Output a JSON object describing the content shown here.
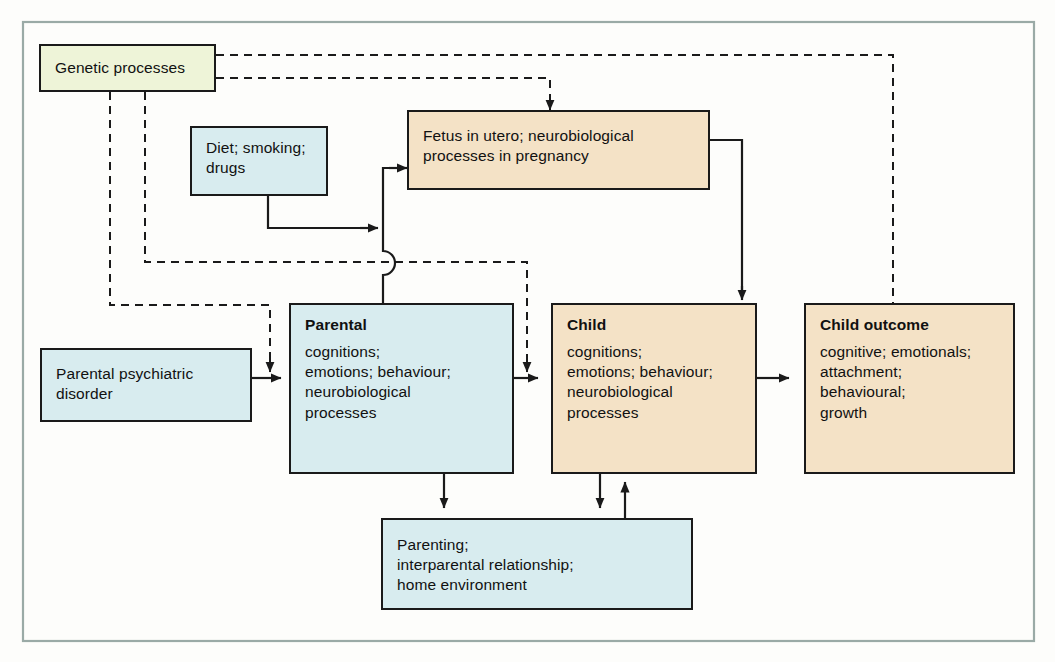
{
  "figure": {
    "kind": "flow-diagram",
    "frame_border_color": "#9aaaa6",
    "background": "#fdfdfb"
  },
  "palette": {
    "genetic_fill": "#eef4d8",
    "parental_fill": "#d8ecef",
    "child_fill": "#f4e2c6",
    "stroke": "#1a1a1a"
  },
  "nodes": {
    "genetic": {
      "id": "genetic-processes",
      "title": "",
      "body": "Genetic processes",
      "fill": "#eef4d8"
    },
    "diet": {
      "id": "diet-smoking-drugs",
      "title": "",
      "body": "Diet; smoking;\ndrugs",
      "fill": "#d8ecef"
    },
    "fetus": {
      "id": "fetus-in-utero",
      "title": "",
      "body": "Fetus in utero; neurobiological\nprocesses in pregnancy",
      "fill": "#f4e2c6"
    },
    "psychiatric": {
      "id": "parental-psychiatric-disorder",
      "title": "",
      "body": "Parental psychiatric\ndisorder",
      "fill": "#d8ecef"
    },
    "parental": {
      "id": "parental",
      "title": "Parental",
      "body": "cognitions;\nemotions; behaviour;\nneurobiological\nprocesses",
      "fill": "#d8ecef"
    },
    "child": {
      "id": "child",
      "title": "Child",
      "body": "cognitions;\nemotions; behaviour;\nneurobiological\nprocesses",
      "fill": "#f4e2c6"
    },
    "child_outcome": {
      "id": "child-outcome",
      "title": "Child outcome",
      "body": "cognitive; emotionals;\nattachment;\nbehavioural;\ngrowth",
      "fill": "#f4e2c6"
    },
    "parenting": {
      "id": "parenting-home-environment",
      "title": "",
      "body": "Parenting;\ninterparental relationship;\nhome environment",
      "fill": "#d8ecef"
    }
  },
  "edges": [
    {
      "id": "genetic-to-child",
      "from": "genetic",
      "to": "child",
      "style": "dashed"
    },
    {
      "id": "genetic-to-fetus",
      "from": "genetic",
      "to": "fetus",
      "style": "dashed"
    },
    {
      "id": "genetic-to-child-2",
      "from": "genetic",
      "to": "child",
      "style": "dashed"
    },
    {
      "id": "genetic-to-parental",
      "from": "genetic",
      "to": "parental",
      "style": "dashed"
    },
    {
      "id": "diet-to-fetus",
      "from": "diet",
      "to": "fetus",
      "style": "solid"
    },
    {
      "id": "parental-to-fetus",
      "from": "parental",
      "to": "fetus",
      "style": "solid"
    },
    {
      "id": "psychiatric-to-parental",
      "from": "psychiatric",
      "to": "parental",
      "style": "solid"
    },
    {
      "id": "parental-to-child",
      "from": "parental",
      "to": "child",
      "style": "solid"
    },
    {
      "id": "fetus-to-child",
      "from": "fetus",
      "to": "child",
      "style": "solid"
    },
    {
      "id": "child-to-child-outcome",
      "from": "child",
      "to": "child_outcome",
      "style": "solid"
    },
    {
      "id": "parental-to-parenting",
      "from": "parental",
      "to": "parenting",
      "style": "solid"
    },
    {
      "id": "child-to-parenting",
      "from": "child",
      "to": "parenting",
      "style": "solid"
    },
    {
      "id": "parenting-to-child",
      "from": "parenting",
      "to": "child",
      "style": "solid"
    }
  ]
}
